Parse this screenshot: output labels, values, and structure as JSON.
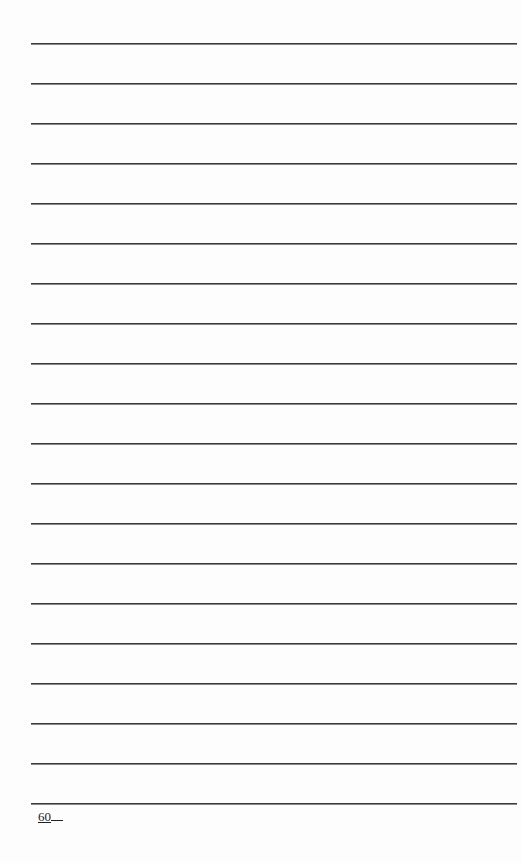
{
  "page": {
    "type": "lined-notebook-page",
    "line_count": 20,
    "line_positions_y": [
      43,
      83,
      123,
      163,
      203,
      243,
      283,
      323,
      363,
      403,
      443,
      483,
      523,
      563,
      603,
      643,
      683,
      723,
      763,
      803
    ],
    "line_color": "#3a3a3a",
    "background_color": "#fdfdfd"
  },
  "footer": {
    "page_number": "60"
  }
}
